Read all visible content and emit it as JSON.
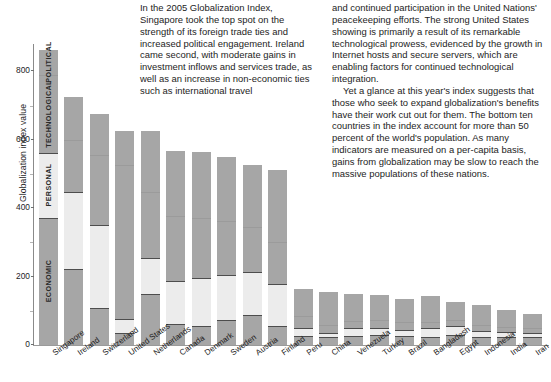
{
  "article": {
    "left_column": [
      "In the 2005 Globalization Index, Singapore took the top spot on the strength of its foreign trade ties and increased political engagement. Ireland came second, with moderate gains in investment inflows and services trade, as well as an increase in non-economic ties such as international travel"
    ],
    "right_column": [
      "and continued participation in the United Nations' peacekeeping efforts. The strong United States showing is primarily a result of its remarkable technological prowess, evidenced by the growth in Internet hosts and secure servers, which are enabling factors for continued technological integration.",
      "Yet a glance at this year's index suggests that those who seek to expand globalization's benefits have their work cut out for them. The bottom ten countries in the index account for more than 50 percent of the world's population. As many indicators are measured on a per-capita basis, gains from globalization may be slow to reach the massive populations of these nations."
    ]
  },
  "chart_data": {
    "type": "bar",
    "stacked": true,
    "title": "",
    "xlabel": "",
    "ylabel": "Globalization index value",
    "ylim": [
      0,
      880
    ],
    "yticks": [
      0,
      200,
      400,
      600,
      800
    ],
    "ytick_labels": [
      "0",
      "200",
      "400",
      "600",
      "800"
    ],
    "grid": false,
    "legend_position": "in-bar",
    "categories": [
      "Singapore",
      "Ireland",
      "Switzerland",
      "United States",
      "Netherlands",
      "Canada",
      "Denmark",
      "Sweden",
      "Austria",
      "Finland",
      "Peru",
      "China",
      "Venezuela",
      "Turkey",
      "Brazil",
      "Bangladesh",
      "Egypt",
      "Indonesia",
      "India",
      "Iran"
    ],
    "series": [
      {
        "name": "ECONOMIC",
        "color": "#a6a6a6",
        "values": [
          372,
          223,
          107,
          35,
          150,
          62,
          55,
          72,
          88,
          57,
          25,
          22,
          27,
          28,
          25,
          22,
          30,
          22,
          23,
          22
        ]
      },
      {
        "name": "PERSONAL",
        "color": "#ececec",
        "values": [
          189,
          225,
          243,
          40,
          105,
          126,
          140,
          132,
          125,
          120,
          25,
          14,
          22,
          22,
          20,
          28,
          25,
          20,
          14,
          12
        ]
      },
      {
        "name": "TECHNOLOGICAL",
        "color": "#a6a6a6",
        "values": [
          227,
          150,
          205,
          450,
          192,
          188,
          175,
          160,
          132,
          125,
          36,
          24,
          22,
          22,
          22,
          18,
          18,
          18,
          16,
          16
        ]
      },
      {
        "name": "POLITICAL",
        "color": "#a6a6a6",
        "values": [
          76,
          127,
          120,
          100,
          178,
          190,
          195,
          185,
          180,
          210,
          78,
          94,
          77,
          74,
          68,
          76,
          53,
          56,
          50,
          42
        ]
      }
    ],
    "totals": [
      864,
      725,
      675,
      625,
      625,
      566,
      565,
      549,
      525,
      512,
      164,
      154,
      148,
      146,
      135,
      144,
      126,
      116,
      103,
      92
    ],
    "legend_labels": [
      "ECONOMIC",
      "PERSONAL",
      "TECHNOLOGICAL",
      "POLITICAL"
    ]
  }
}
